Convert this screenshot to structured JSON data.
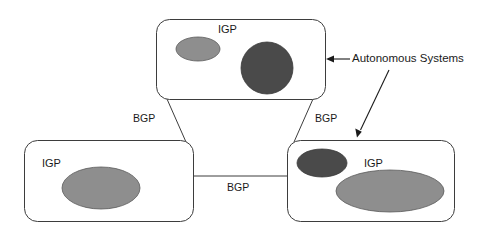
{
  "diagram": {
    "background_color": "#ffffff",
    "stroke_color": "#3d3d3d",
    "text_color": "#1a1a1a",
    "fill_medium_gray": "#8e8e8e",
    "fill_dark_gray": "#4a4a4a",
    "box_fill": "#ffffff"
  },
  "autonomous_systems": [
    {
      "id": "as-top",
      "igp_label": "IGP",
      "networks": [
        {
          "shape": "ellipse",
          "color": "#8e8e8e"
        },
        {
          "shape": "circle",
          "color": "#4a4a4a"
        }
      ]
    },
    {
      "id": "as-left",
      "igp_label": "IGP",
      "networks": [
        {
          "shape": "ellipse",
          "color": "#8e8e8e"
        }
      ]
    },
    {
      "id": "as-right",
      "igp_label": "IGP",
      "networks": [
        {
          "shape": "ellipse",
          "color": "#4a4a4a"
        },
        {
          "shape": "ellipse",
          "color": "#8e8e8e"
        }
      ]
    }
  ],
  "connections": [
    {
      "id": "bgp-top-left",
      "label": "BGP",
      "from": "as-top",
      "to": "as-left"
    },
    {
      "id": "bgp-top-right",
      "label": "BGP",
      "from": "as-top",
      "to": "as-right"
    },
    {
      "id": "bgp-left-right",
      "label": "BGP",
      "from": "as-left",
      "to": "as-right"
    }
  ],
  "callout": {
    "label": "Autonomous Systems",
    "points_to": [
      "as-top",
      "as-right"
    ]
  }
}
